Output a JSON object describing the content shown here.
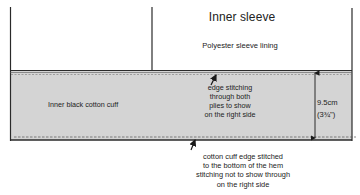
{
  "diagram": {
    "sleeve": {
      "title": "Inner sleeve",
      "material": "Polyester sleeve lining"
    },
    "cuff": {
      "label": "Inner black cotton cuff",
      "fill_color": "#d4d4d4"
    },
    "annotations": {
      "top_stitching": {
        "lines": [
          "edge stitching",
          "through both",
          "plies to show",
          "on the right side"
        ]
      },
      "bottom_stitching": {
        "lines": [
          "cotton cuff edge stitched",
          "to the bottom of the hem",
          "stitching not to show through",
          "on the right side"
        ]
      },
      "measurement": {
        "metric": "9.5cm",
        "imperial": "(3¾\")"
      }
    },
    "colors": {
      "line": "#2a2a2a",
      "cuff_fill": "#d4d4d4",
      "background": "#ffffff"
    }
  }
}
